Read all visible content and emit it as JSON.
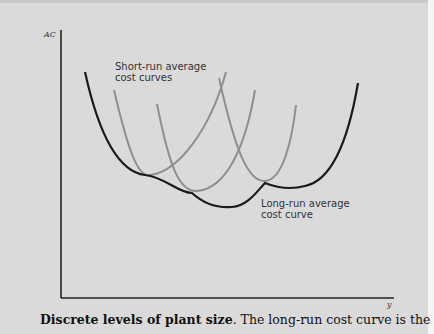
{
  "figure": {
    "y_axis_label": "AC",
    "x_axis_label": "y",
    "annotations": {
      "short_run": [
        "Short-run average",
        "cost curves"
      ],
      "long_run": [
        "Long-run average",
        "cost curve"
      ]
    },
    "colors": {
      "long_run_curve": "#1a1a1a",
      "short_run_curves": "#8a8a8a",
      "background": "#dadada"
    }
  },
  "caption": {
    "title": "Discrete levels of plant size",
    "text": ". The long-run cost curve is the"
  }
}
